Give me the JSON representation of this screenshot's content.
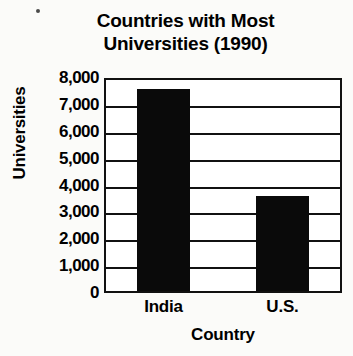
{
  "chart_data": {
    "type": "bar",
    "title": "Countries with Most Universities (1990)",
    "title_lines": [
      "Countries with Most",
      "Universities (1990)"
    ],
    "categories": [
      "India",
      "U.S."
    ],
    "values": [
      7600,
      3600
    ],
    "xlabel": "Country",
    "ylabel": "Universities",
    "ylim": [
      0,
      8000
    ],
    "ytick_labels": [
      "8,000",
      "7,000",
      "6,000",
      "5,000",
      "4,000",
      "3,000",
      "2,000",
      "1,000",
      "0"
    ],
    "ytick_values": [
      8000,
      7000,
      6000,
      5000,
      4000,
      3000,
      2000,
      1000,
      0
    ],
    "grid": true,
    "legend": null,
    "bar_color": "#0a0a0a",
    "axis_color": "#111111",
    "background": "#fbfbf9"
  }
}
